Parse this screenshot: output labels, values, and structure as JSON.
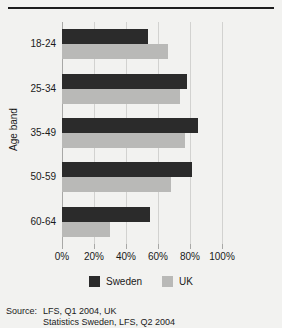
{
  "chart_data": {
    "type": "bar",
    "orientation": "horizontal",
    "title": "",
    "xlabel": "",
    "ylabel": "Age band",
    "categories": [
      "18-24",
      "25-34",
      "35-49",
      "50-59",
      "60-64"
    ],
    "series": [
      {
        "name": "Sweden",
        "color": "#2b2b2b",
        "values": [
          54,
          78,
          85,
          81,
          55
        ]
      },
      {
        "name": "UK",
        "color": "#b9b9b7",
        "values": [
          66,
          74,
          77,
          68,
          30
        ]
      }
    ],
    "xlim": [
      0,
      100
    ],
    "xticks": [
      0,
      20,
      40,
      60,
      80,
      100
    ],
    "xtick_labels": [
      "0%",
      "20%",
      "40%",
      "60%",
      "80%",
      "100%"
    ],
    "grid": true,
    "legend_position": "bottom"
  },
  "legend": {
    "items": [
      {
        "label": "Sweden",
        "swatch": "sweden"
      },
      {
        "label": "UK",
        "swatch": "uk"
      }
    ]
  },
  "source": {
    "label": "Source:",
    "lines": [
      "LFS, Q1 2004, UK",
      "Statistics Sweden, LFS, Q2 2004"
    ]
  }
}
